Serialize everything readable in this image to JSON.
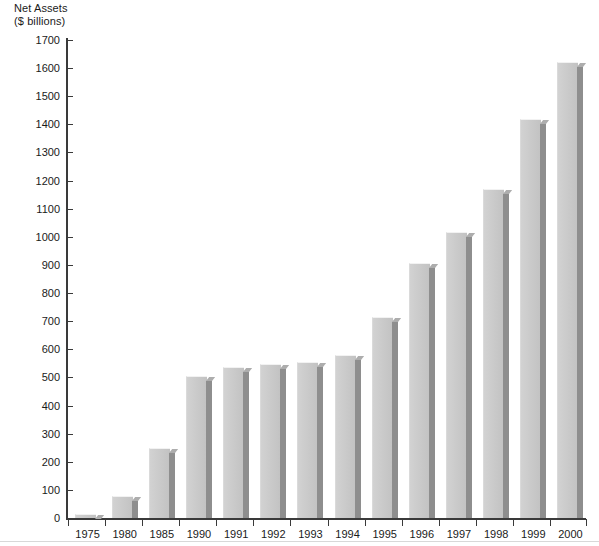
{
  "chart_data": {
    "type": "bar",
    "title": "",
    "ylabel": "Net Assets ($ billions)",
    "ylabel_lines": [
      "Net Assets",
      "($ billions)"
    ],
    "xlabel": "",
    "ylim": [
      0,
      1700
    ],
    "ytick_step": 100,
    "yticks": [
      0,
      100,
      200,
      300,
      400,
      500,
      600,
      700,
      800,
      900,
      1000,
      1100,
      1200,
      1300,
      1400,
      1500,
      1600,
      1700
    ],
    "ytick_labels": [
      "0",
      "100",
      "200",
      "300",
      "400",
      "500",
      "600",
      "700",
      "800",
      "900",
      "1000",
      "1100",
      "1200",
      "1300",
      "1400",
      "1500",
      "1600",
      "1700"
    ],
    "categories": [
      "1975",
      "1980",
      "1985",
      "1990",
      "1991",
      "1992",
      "1993",
      "1994",
      "1995",
      "1996",
      "1997",
      "1998",
      "1999",
      "2000"
    ],
    "values": [
      10,
      75,
      245,
      500,
      535,
      545,
      550,
      575,
      710,
      905,
      1015,
      1165,
      1415,
      1620
    ],
    "grid": false,
    "legend": null,
    "bar_style": "3d-shadow-gray",
    "colors": {
      "bar_face": "#c9c9c9",
      "bar_shadow": "#8e8e8e",
      "bar_top": "#adadad",
      "axis": "#3a3a3a",
      "text": "#1a1a1a",
      "background": "#ffffff"
    }
  }
}
